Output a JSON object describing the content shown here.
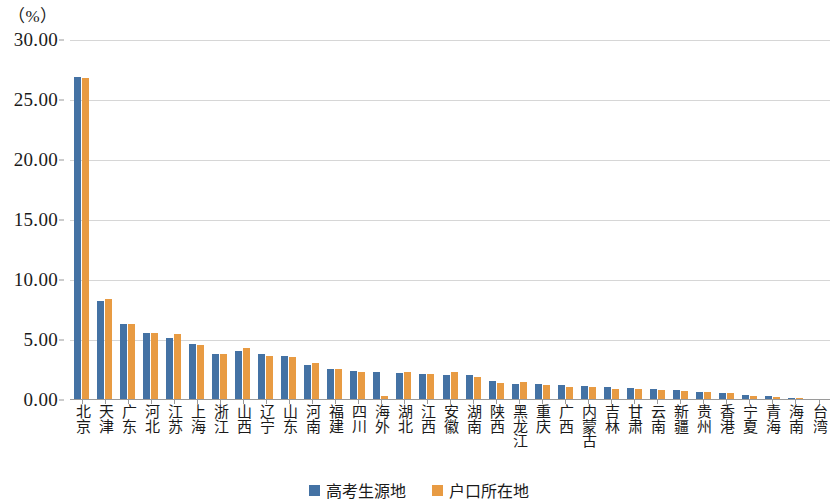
{
  "chart_data": {
    "type": "bar",
    "title": "",
    "subtitle": "",
    "unit_caption": "（%）",
    "xlabel": "",
    "ylabel": "",
    "ylim": [
      0,
      30
    ],
    "ytick_step": 5,
    "ytick_labels": [
      "30.00",
      "25.00",
      "20.00",
      "15.00",
      "10.00",
      "5.00",
      "0.00"
    ],
    "ytick_values": [
      30,
      25,
      20,
      15,
      10,
      5,
      0
    ],
    "grid": true,
    "legend_position": "bottom",
    "categories": [
      "北京",
      "天津",
      "广东",
      "河北",
      "江苏",
      "上海",
      "浙江",
      "山西",
      "辽宁",
      "山东",
      "河南",
      "福建",
      "四川",
      "海外",
      "湖北",
      "江西",
      "安徽",
      "湖南",
      "陕西",
      "黑龙江",
      "重庆",
      "广西",
      "内蒙古",
      "吉林",
      "甘肃",
      "云南",
      "新疆",
      "贵州",
      "香港",
      "宁夏",
      "青海",
      "海南",
      "台湾"
    ],
    "series": [
      {
        "name": "高考生源地",
        "color": "#4472a4",
        "values": [
          26.9,
          8.25,
          6.3,
          5.55,
          5.2,
          4.65,
          3.85,
          4.1,
          3.85,
          3.7,
          2.95,
          2.55,
          2.4,
          2.3,
          2.25,
          2.2,
          2.1,
          2.05,
          1.55,
          1.35,
          1.3,
          1.25,
          1.2,
          1.1,
          1.0,
          0.95,
          0.8,
          0.7,
          0.6,
          0.4,
          0.3,
          0.2,
          0.12
        ]
      },
      {
        "name": "户口所在地",
        "color": "#e89b43",
        "values": [
          26.85,
          8.45,
          6.35,
          5.6,
          5.5,
          4.55,
          3.8,
          4.35,
          3.7,
          3.6,
          3.1,
          2.6,
          2.35,
          0.35,
          2.3,
          2.2,
          2.35,
          1.95,
          1.45,
          1.5,
          1.25,
          1.05,
          1.1,
          0.95,
          0.9,
          0.85,
          0.75,
          0.65,
          0.55,
          0.35,
          0.22,
          0.15,
          0.1
        ]
      }
    ],
    "legend": [
      "高考生源地",
      "户口所在地"
    ]
  }
}
